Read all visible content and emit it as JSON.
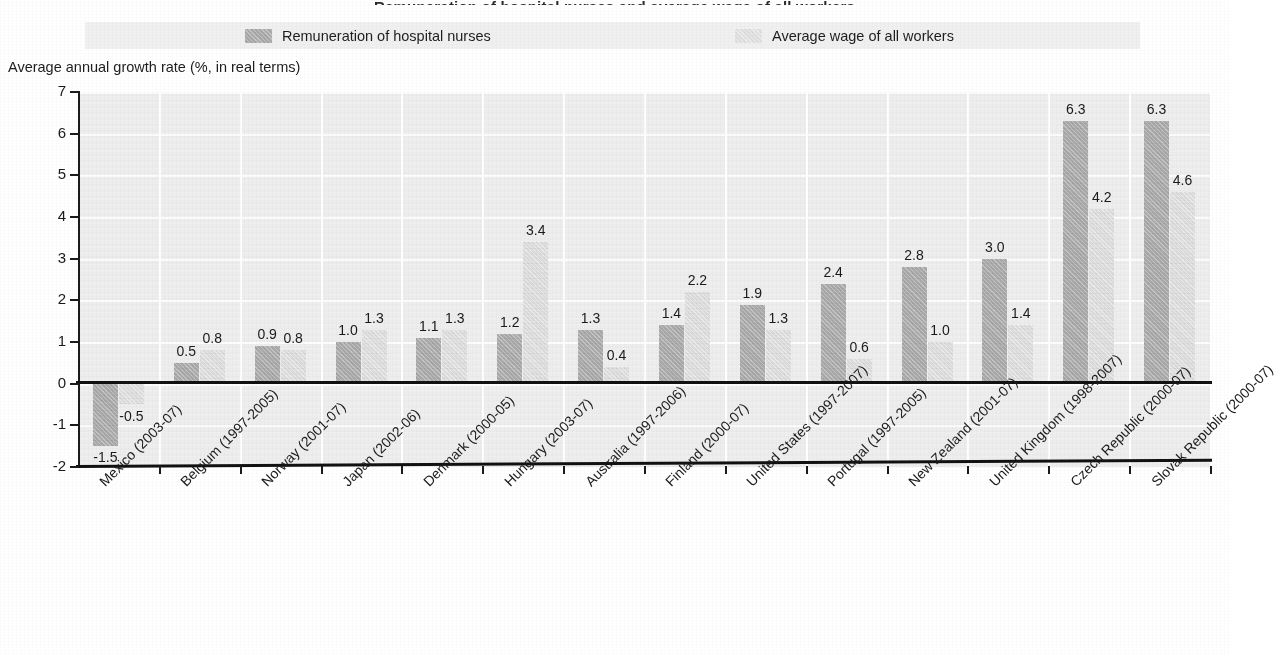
{
  "title_sliver": "Remuneration of hospital nurses and average wage of all workers",
  "legend": {
    "items": [
      {
        "label": "Remuneration of hospital nurses",
        "swatch": "dark",
        "color": "#a9a9a9"
      },
      {
        "label": "Average wage of all workers",
        "swatch": "light",
        "color": "#dcdcdc"
      }
    ]
  },
  "axis": {
    "y_title": "Average annual growth rate (%, in real terms)",
    "y_ticks": [
      "7",
      "6",
      "5",
      "4",
      "3",
      "2",
      "1",
      "0",
      "-1",
      "-2"
    ]
  },
  "chart_data": {
    "type": "bar",
    "title": "Remuneration of hospital nurses and average wage of all workers",
    "xlabel": "",
    "ylabel": "Average annual growth rate (%, in real terms)",
    "ylim": [
      -2,
      7
    ],
    "ytick_step": 1,
    "grid": true,
    "legend_position": "top",
    "categories": [
      "Mexico (2003-07)",
      "Belgium (1997-2005)",
      "Norway (2001-07)",
      "Japan (2002-06)",
      "Denmark (2000-05)",
      "Hungary (2003-07)",
      "Australia (1997-2006)",
      "Finland (2000-07)",
      "United States (1997-2007)",
      "Portugal (1997-2005)",
      "New Zealand (2001-07)",
      "United Kingdom (1998-2007)",
      "Czech Republic (2000-07)",
      "Slovak Republic (2000-07)"
    ],
    "series": [
      {
        "name": "Remuneration of hospital nurses",
        "color": "#a9a9a9",
        "values": [
          -1.5,
          0.5,
          0.9,
          1.0,
          1.1,
          1.2,
          1.3,
          1.4,
          1.9,
          2.4,
          2.8,
          3.0,
          6.3,
          6.3
        ],
        "labels": [
          "-1.5",
          "0.5",
          "0.9",
          "1.0",
          "1.1",
          "1.2",
          "1.3",
          "1.4",
          "1.9",
          "2.4",
          "2.8",
          "3.0",
          "6.3",
          "6.3"
        ]
      },
      {
        "name": "Average wage of all workers",
        "color": "#dcdcdc",
        "values": [
          -0.5,
          0.8,
          0.8,
          1.3,
          1.3,
          3.4,
          0.4,
          2.2,
          1.3,
          0.6,
          1.0,
          1.4,
          4.2,
          4.6
        ],
        "labels": [
          "-0.5",
          "0.8",
          "0.8",
          "1.3",
          "1.3",
          "3.4",
          "0.4",
          "2.2",
          "1.3",
          "0.6",
          "1.0",
          "1.4",
          "4.2",
          "4.6"
        ]
      }
    ]
  }
}
